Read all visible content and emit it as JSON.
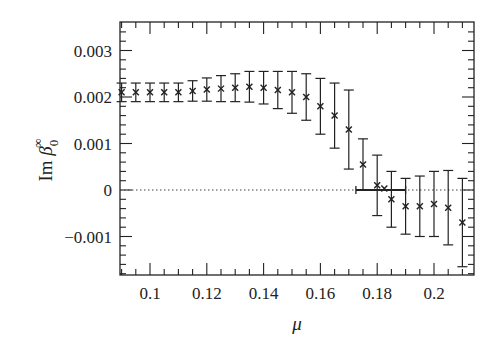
{
  "chart_data": {
    "type": "scatter",
    "title": "",
    "xlabel": "μ",
    "ylabel": "Im β0∞",
    "ylabel_parts": {
      "prefix": "Im ",
      "symbol": "β",
      "subscript": "0",
      "superscript": "∞"
    },
    "xlim": [
      0.088,
      0.213
    ],
    "ylim": [
      -0.00182,
      0.00362
    ],
    "x_ticks": [
      0.1,
      0.12,
      0.14,
      0.16,
      0.18,
      0.2
    ],
    "x_tick_labels": [
      "0.1",
      "0.12",
      "0.14",
      "0.16",
      "0.18",
      "0.2"
    ],
    "y_ticks": [
      -0.001,
      0,
      0.001,
      0.002,
      0.003
    ],
    "y_tick_labels": [
      "−0.001",
      "0",
      "0.001",
      "0.002",
      "0.003"
    ],
    "grid": false,
    "reference_line": {
      "y": 0,
      "style": "dotted"
    },
    "marker": "x",
    "series": [
      {
        "name": "Im beta_0 infinity",
        "x": [
          0.09,
          0.095,
          0.1,
          0.105,
          0.11,
          0.115,
          0.12,
          0.125,
          0.13,
          0.135,
          0.14,
          0.145,
          0.15,
          0.155,
          0.16,
          0.165,
          0.17,
          0.175,
          0.18,
          0.1825,
          0.185,
          0.19,
          0.195,
          0.2,
          0.205,
          0.21
        ],
        "y": [
          0.0021,
          0.0021,
          0.0021,
          0.0021,
          0.0021,
          0.00213,
          0.00216,
          0.00218,
          0.0022,
          0.00222,
          0.0022,
          0.00215,
          0.0021,
          0.002,
          0.0018,
          0.0016,
          0.0013,
          0.00055,
          0.0001,
          3e-05,
          -0.0002,
          -0.00035,
          -0.00035,
          -0.0003,
          -0.00038,
          -0.0007
        ],
        "err": [
          0.0002,
          0.0002,
          0.0002,
          0.0002,
          0.0002,
          0.00022,
          0.00025,
          0.00028,
          0.0003,
          0.00033,
          0.00035,
          0.0004,
          0.00045,
          0.0005,
          0.0006,
          0.0007,
          0.00085,
          0.00055,
          0.00065,
          0.0,
          0.0006,
          0.0006,
          0.00065,
          0.0007,
          0.0008,
          0.00095
        ]
      }
    ],
    "horizontal_error_bar": {
      "x_from": 0.1725,
      "x_to": 0.19,
      "y": 0.0
    }
  }
}
